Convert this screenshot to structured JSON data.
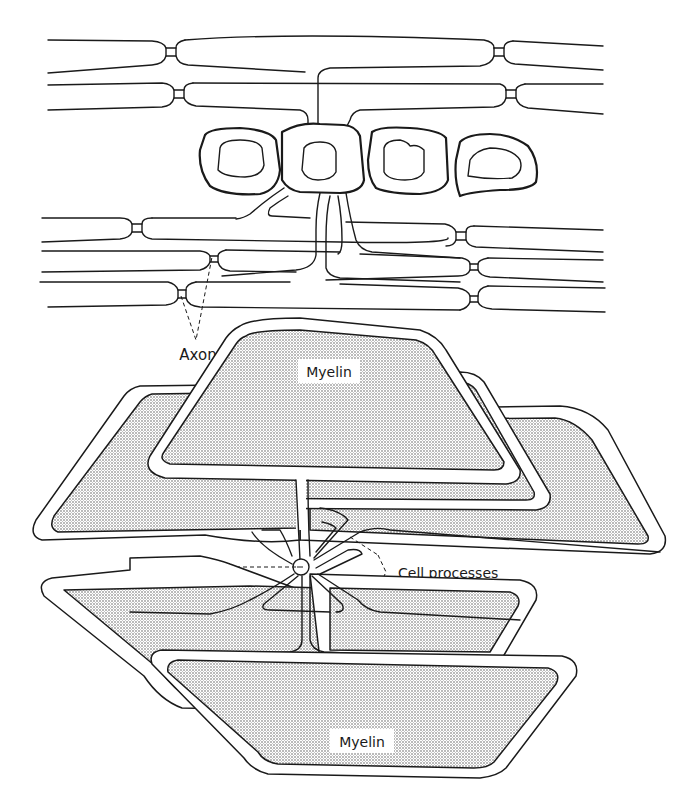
{
  "figure": {
    "top_panel": {
      "description": "Longitudinal view of myelinated axons with oligodendrocyte cell bodies",
      "labels": {
        "axon": "Axon"
      }
    },
    "bottom_panel": {
      "description": "Oligodendrocyte with cell processes extending to myelin sheets",
      "labels": {
        "myelin_top": "Myelin",
        "myelin_bottom": "Myelin",
        "nucleus": "Nucleus",
        "cell_processes": "Cell processes"
      }
    }
  },
  "colors": {
    "line": "#1a1a1a",
    "background": "#ffffff",
    "stipple": "#555555"
  }
}
